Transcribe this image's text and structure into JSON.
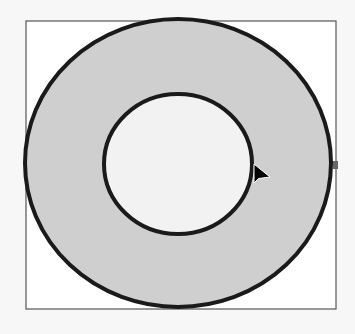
{
  "diagram": {
    "type": "annulus",
    "frame": {
      "x": 26,
      "y": 21,
      "width": 310,
      "height": 288,
      "stroke": "#555555",
      "fill": "#ffffff"
    },
    "outer_ellipse": {
      "cx": 178,
      "cy": 163,
      "rx": 153,
      "ry": 144,
      "fill": "#cfcfcf",
      "stroke": "#1a1a1a"
    },
    "inner_ellipse": {
      "cx": 178,
      "cy": 164,
      "rx": 74,
      "ry": 70,
      "fill": "#f2f2f2",
      "stroke": "#1a1a1a"
    },
    "cursor": {
      "x": 254,
      "y": 164,
      "icon": "arrow-cursor-icon"
    },
    "handle": {
      "x": 335,
      "y": 165,
      "color": "#666666"
    }
  }
}
